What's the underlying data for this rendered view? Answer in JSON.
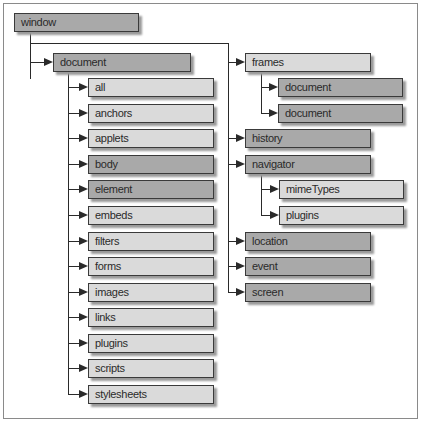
{
  "diagram": {
    "root": {
      "label": "window",
      "shade": "dark"
    },
    "left_branch": {
      "parent": {
        "label": "document",
        "shade": "dark"
      },
      "children": [
        {
          "label": "all",
          "shade": "light"
        },
        {
          "label": "anchors",
          "shade": "light"
        },
        {
          "label": "applets",
          "shade": "light"
        },
        {
          "label": "body",
          "shade": "dark"
        },
        {
          "label": "element",
          "shade": "dark"
        },
        {
          "label": "embeds",
          "shade": "light"
        },
        {
          "label": "filters",
          "shade": "light"
        },
        {
          "label": "forms",
          "shade": "light"
        },
        {
          "label": "images",
          "shade": "light"
        },
        {
          "label": "links",
          "shade": "light"
        },
        {
          "label": "plugins",
          "shade": "light"
        },
        {
          "label": "scripts",
          "shade": "light"
        },
        {
          "label": "stylesheets",
          "shade": "light"
        }
      ]
    },
    "right_branch": {
      "items": [
        {
          "label": "frames",
          "shade": "light",
          "children": [
            {
              "label": "document",
              "shade": "dark"
            },
            {
              "label": "document",
              "shade": "dark"
            }
          ]
        },
        {
          "label": "history",
          "shade": "dark"
        },
        {
          "label": "navigator",
          "shade": "dark",
          "children": [
            {
              "label": "mimeTypes",
              "shade": "light"
            },
            {
              "label": "plugins",
              "shade": "light"
            }
          ]
        },
        {
          "label": "location",
          "shade": "dark"
        },
        {
          "label": "event",
          "shade": "dark"
        },
        {
          "label": "screen",
          "shade": "dark"
        }
      ]
    },
    "colors": {
      "dark": "#a9a9a9",
      "light": "#dadada",
      "line": "#2a2a2a",
      "border": "#3a3a3a"
    }
  }
}
